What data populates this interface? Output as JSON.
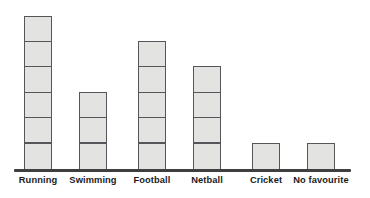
{
  "chart_data": {
    "type": "bar",
    "title": "",
    "subtitle": "",
    "xlabel": "",
    "ylabel": "",
    "categories": [
      "Running",
      "Swimming",
      "Football",
      "Netball",
      "Cricket",
      "No favourite"
    ],
    "values": [
      6,
      3,
      5,
      4,
      1,
      1
    ],
    "series": [
      {
        "name": "Number of pupils",
        "values": [
          6,
          3,
          5,
          4,
          1,
          1
        ]
      }
    ],
    "ylim": [
      0,
      6
    ],
    "grid": false,
    "legend": false,
    "legend_position": "none",
    "unit_blocks": true,
    "block_unit_value": 1,
    "axis_tick_labels": [],
    "annotations": []
  },
  "style": {
    "background_color": "#ffffff",
    "block_fill_color": "#e3e3e1",
    "block_border_color": "#55565a",
    "axis_color": "#3f3f3f",
    "label_color": "#1b1b1b"
  },
  "geometry": {
    "baseline_y": 170,
    "block_height": 26.6,
    "bar_width": 28,
    "bar_centers": [
      38,
      93,
      152,
      207,
      266,
      321
    ]
  }
}
